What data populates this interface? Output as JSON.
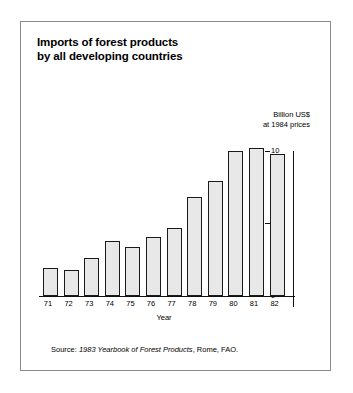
{
  "figure": {
    "title_line1": "Imports of forest products",
    "title_line2": "by all developing countries",
    "unit_line1": "Billion US$",
    "unit_line2": "at 1984 prices",
    "source_prefix": "Source: ",
    "source_italic": "1983 Yearbook of Forest Products",
    "source_suffix": ", Rome, FAO.",
    "frame_color": "#8a8a8a",
    "bar_fill": "#e8e8e8",
    "bar_stroke": "#1a1a1a"
  },
  "chart_data": {
    "type": "bar",
    "title": "Imports of forest products by all developing countries",
    "xlabel": "Year",
    "ylabel": "Billion US$ at 1984 prices",
    "categories": [
      "71",
      "72",
      "73",
      "74",
      "75",
      "76",
      "77",
      "78",
      "79",
      "80",
      "81",
      "82"
    ],
    "values": [
      1.9,
      1.8,
      2.6,
      3.8,
      3.4,
      4.1,
      4.7,
      6.8,
      7.9,
      10.0,
      10.2,
      9.8
    ],
    "ylim": [
      0,
      10.8
    ],
    "yticks": [
      0,
      5,
      10
    ],
    "ytick_labels": [
      "0",
      "5",
      "10"
    ],
    "grid": false,
    "legend": null,
    "axis_position": "right",
    "annotations": [
      "Billion US$ at 1984 prices"
    ],
    "source": "Source: 1983 Yearbook of Forest Products, Rome, FAO."
  }
}
